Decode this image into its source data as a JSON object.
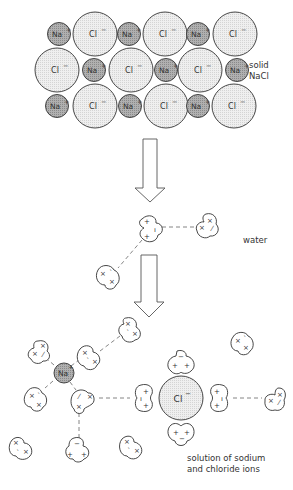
{
  "labels": {
    "solid_1": "solid",
    "solid_2": "NaCl",
    "water": "water",
    "solution_1": "solution of sodium",
    "solution_2": "and chloride ions"
  },
  "ions": {
    "na": "Na",
    "na_charge": "+",
    "cl": "Cl",
    "cl_charge": "−"
  },
  "colors": {
    "na_fill": "#a9a9a9",
    "cl_fill": "#ececec",
    "stroke": "#333333",
    "dash": "#666666"
  },
  "lattice": {
    "rows": [
      [
        "Na+",
        "Cl-",
        "Na+",
        "Cl-",
        "Na+",
        "Cl-"
      ],
      [
        "Cl-",
        "Na+",
        "Cl-",
        "Na+",
        "Cl-",
        "Na+"
      ],
      [
        "Na+",
        "Cl-",
        "Na+",
        "Cl-",
        "Na+",
        "Cl-"
      ]
    ]
  },
  "stages": [
    "solid NaCl",
    "water",
    "solution of sodium and chloride ions"
  ]
}
